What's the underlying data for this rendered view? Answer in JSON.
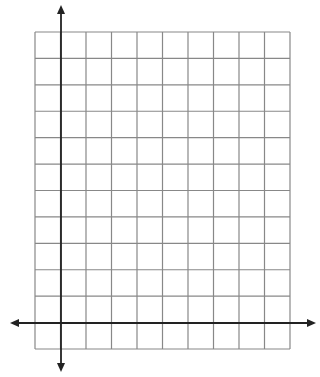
{
  "diagram": {
    "type": "coordinate-grid",
    "grid": {
      "left": 35,
      "top": 32,
      "right": 290,
      "bottom": 349,
      "columns": 10,
      "rows": 12,
      "line_color": "#888888"
    },
    "axes": {
      "x_axis_y": 323,
      "x_from": 10,
      "x_to": 316,
      "y_axis_x": 61,
      "y_from": 372,
      "y_to": 5,
      "color": "#222222"
    }
  }
}
